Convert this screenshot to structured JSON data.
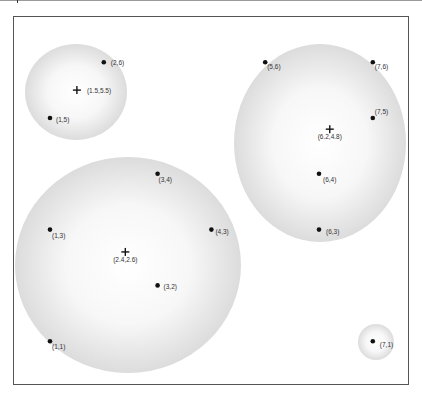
{
  "diagram": {
    "colors": {
      "frame": "#555555",
      "cluster_fill_edge": "#d9d9d9",
      "cluster_fill_center": "#ffffff",
      "point": "#111111",
      "text": "#333333"
    },
    "clusters": [
      {
        "id": "cluster-a",
        "centroid": [
          1.5,
          5.5
        ],
        "centroid_label": "(1.5,5.5)",
        "points": [
          {
            "x": 2,
            "y": 6,
            "label": "(2,6)"
          },
          {
            "x": 1,
            "y": 5,
            "label": "(1,5)"
          }
        ]
      },
      {
        "id": "cluster-b",
        "centroid": [
          2.4,
          2.6
        ],
        "centroid_label": "(2.4,2.6)",
        "points": [
          {
            "x": 3,
            "y": 4,
            "label": "(3,4)"
          },
          {
            "x": 1,
            "y": 3,
            "label": "(1,3)"
          },
          {
            "x": 4,
            "y": 3,
            "label": "(4,3)"
          },
          {
            "x": 3,
            "y": 2,
            "label": "(3,2)"
          },
          {
            "x": 1,
            "y": 1,
            "label": "(1,1)"
          }
        ]
      },
      {
        "id": "cluster-c",
        "centroid": [
          6.2,
          4.8
        ],
        "centroid_label": "(6.2,4.8)",
        "points": [
          {
            "x": 5,
            "y": 6,
            "label": "(5,6)"
          },
          {
            "x": 7,
            "y": 6,
            "label": "(7,6)"
          },
          {
            "x": 7,
            "y": 5,
            "label": "(7,5)"
          },
          {
            "x": 6,
            "y": 4,
            "label": "(6,4)"
          },
          {
            "x": 6,
            "y": 3,
            "label": "(6,3)"
          }
        ]
      },
      {
        "id": "cluster-d",
        "centroid": null,
        "centroid_label": "",
        "points": [
          {
            "x": 7,
            "y": 1,
            "label": "(7,1)"
          }
        ]
      }
    ]
  }
}
